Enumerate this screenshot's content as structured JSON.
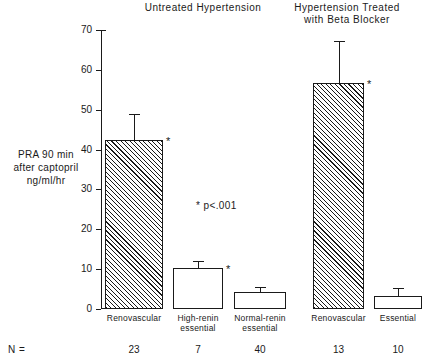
{
  "chart_data": {
    "type": "bar",
    "title": "",
    "xlabel": "",
    "ylabel": "PRA 90 min\nafter captopril\nng/ml/hr",
    "ylim": [
      0,
      70
    ],
    "yticks": [
      0,
      10,
      20,
      30,
      40,
      50,
      60,
      70
    ],
    "ytick_labels": [
      "0",
      "10",
      "20",
      "30",
      "40",
      "50",
      "60",
      "70"
    ],
    "grid": false,
    "legend": "none",
    "annotation": "* p<.001",
    "group_headers": [
      "Untreated  Hypertension",
      "Hypertension Treated\nwith Beta Blocker"
    ],
    "categories": [
      "Renovascular",
      "High-renin\nessential",
      "Normal-renin\nessential",
      "Renovascular",
      "Essential"
    ],
    "values": [
      42.3,
      10.3,
      4.3,
      56.8,
      3.3
    ],
    "error_high": [
      48.8,
      11.7,
      5.3,
      67.0,
      5.0
    ],
    "n_label": "N =",
    "n_values": [
      "23",
      "7",
      "40",
      "13",
      "10"
    ],
    "significant": [
      true,
      true,
      false,
      true,
      false
    ],
    "significance_marker": "*",
    "fills": [
      "hatched",
      "open",
      "open",
      "hatched",
      "open"
    ],
    "colors": {
      "ink": "#1a1a1a",
      "background": "#ffffff",
      "bar_open": "#ffffff",
      "bar_hatch": "#1a1a1a"
    }
  },
  "axis": {
    "y_title": "PRA 90 min\nafter captopril\nng/ml/hr"
  },
  "headers": {
    "untreated": "Untreated  Hypertension",
    "treated": "Hypertension Treated\nwith Beta Blocker"
  },
  "note": {
    "p_value": "* p<.001"
  },
  "n_row": {
    "label": "N ="
  }
}
